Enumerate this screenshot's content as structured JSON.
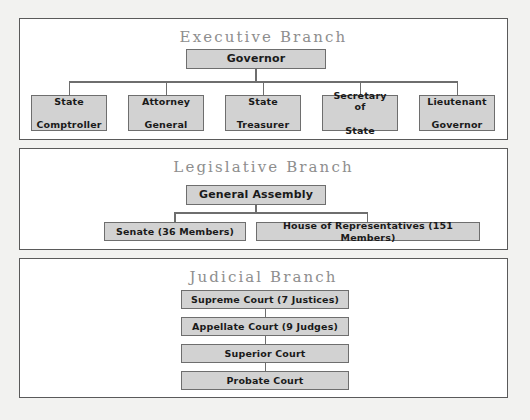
{
  "diagram": {
    "panels": [
      {
        "id": "executive",
        "title": "Executive Branch",
        "root": "Governor",
        "children": [
          "State\nComptroller",
          "Attorney\nGeneral",
          "State\nTreasurer",
          "Secretary of\nState",
          "Lieutenant\nGovernor"
        ],
        "children_lines": {
          "state_comptroller": [
            "State",
            "Comptroller"
          ],
          "attorney_general": [
            "Attorney",
            "General"
          ],
          "state_treasurer": [
            "State",
            "Treasurer"
          ],
          "secretary_of_state": [
            "Secretary of",
            "State"
          ],
          "lieutenant_governor": [
            "Lieutenant",
            "Governor"
          ]
        }
      },
      {
        "id": "legislative",
        "title": "Legislative Branch",
        "root": "General Assembly",
        "children": [
          "Senate (36 Members)",
          "House of Representatives (151 Members)"
        ]
      },
      {
        "id": "judicial",
        "title": "Judicial Branch",
        "chain": [
          "Supreme Court (7 Justices)",
          "Appellate Court (9 Judges)",
          "Superior Court",
          "Probate Court"
        ]
      }
    ]
  },
  "colors": {
    "page_background": "#f2f2f0",
    "panel_background": "#ffffff",
    "panel_border": "#5a5a5a",
    "node_fill": "#d2d2d2",
    "node_border": "#6e6e6e",
    "node_text": "#1a1a1a",
    "title_text": "#8e8e8e",
    "connector": "#6e6e6e"
  }
}
